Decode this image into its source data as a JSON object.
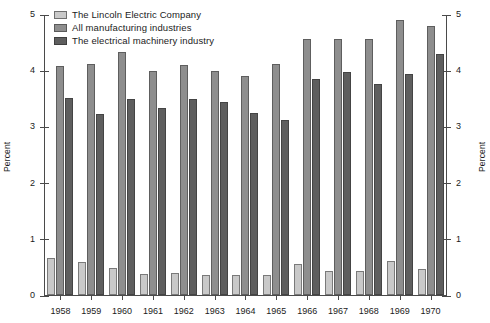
{
  "chart_data": {
    "type": "bar",
    "title": "",
    "subtitle": "",
    "xlabel": "",
    "ylabel": "Percent",
    "ylabel_right": "Percent",
    "ylim": [
      0,
      5
    ],
    "yticks": [
      0,
      1,
      2,
      3,
      4,
      5
    ],
    "ytick_labels": [
      "0",
      "1",
      "2",
      "3",
      "4",
      "5"
    ],
    "grid": false,
    "legend_position": "top-left",
    "categories": [
      "1958",
      "1959",
      "1960",
      "1961",
      "1962",
      "1963",
      "1964",
      "1965",
      "1966",
      "1967",
      "1968",
      "1969",
      "1970"
    ],
    "series": [
      {
        "name": "The Lincoln Electric Company",
        "color": "#c9c9c9",
        "values": [
          0.66,
          0.59,
          0.48,
          0.38,
          0.4,
          0.36,
          0.35,
          0.36,
          0.55,
          0.43,
          0.43,
          0.6,
          0.47
        ]
      },
      {
        "name": "All manufacturing industries",
        "color": "#8e8e8e",
        "values": [
          4.08,
          4.11,
          4.32,
          3.99,
          4.09,
          3.98,
          3.89,
          4.11,
          4.56,
          4.55,
          4.55,
          4.9,
          4.78
        ]
      },
      {
        "name": "The electrical machinery industry",
        "color": "#5e5e5e",
        "values": [
          3.5,
          3.22,
          3.49,
          3.33,
          3.48,
          3.43,
          3.24,
          3.12,
          3.84,
          3.97,
          3.76,
          3.94,
          4.28
        ]
      }
    ]
  },
  "legend": {
    "items": [
      {
        "label": "The Lincoln Electric Company",
        "color": "#c9c9c9"
      },
      {
        "label": "All manufacturing industries",
        "color": "#8e8e8e"
      },
      {
        "label": "The electrical machinery industry",
        "color": "#5e5e5e"
      }
    ]
  },
  "axes": {
    "left_title": "Percent",
    "right_title": "Percent"
  }
}
